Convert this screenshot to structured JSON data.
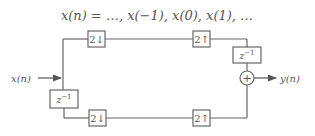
{
  "title": {
    "lhs": "x(n)",
    "eq": " = ",
    "rhs": "…, x(−1), x(0), x(1), …"
  },
  "input": {
    "label": "x(n)"
  },
  "output": {
    "label": "y(n)"
  },
  "blocks": {
    "top_downsample": "2↓",
    "top_upsample": "2↑",
    "bottom_downsample": "2↓",
    "bottom_upsample": "2↑",
    "input_delay_base": "z",
    "input_delay_exp": "−1",
    "output_delay_base": "z",
    "output_delay_exp": "−1",
    "sum_symbol": "+"
  },
  "colors": {
    "line": "#666666",
    "box_fill": "#ffffff",
    "text": "#555555"
  }
}
